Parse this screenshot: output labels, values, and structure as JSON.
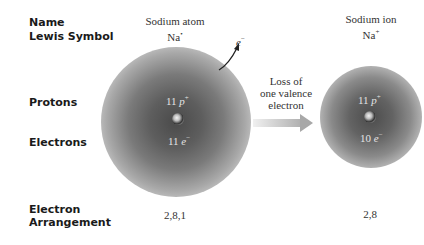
{
  "row_labels": {
    "name": "Name",
    "lewis_symbol": "Lewis Symbol",
    "protons": "Protons",
    "electrons": "Electrons",
    "electron_arrangement_line1": "Electron",
    "electron_arrangement_line2": "Arrangement"
  },
  "sodium_atom": {
    "name": "Sodium atom",
    "symbol": "Na",
    "symbol_mark": "•",
    "protons_count": "11",
    "protons_symbol": "p",
    "protons_charge": "+",
    "electrons_count": "11",
    "electrons_symbol": "e",
    "electrons_charge": "−",
    "arrangement": "2,8,1"
  },
  "lost_electron": {
    "symbol": "e",
    "charge": "−"
  },
  "process": {
    "line1": "Loss of",
    "line2": "one valence",
    "line3": "electron"
  },
  "sodium_ion": {
    "name": "Sodium ion",
    "symbol": "Na",
    "symbol_mark": "+",
    "protons_count": "11",
    "protons_symbol": "p",
    "protons_charge": "+",
    "electrons_count": "10",
    "electrons_symbol": "e",
    "electrons_charge": "−",
    "arrangement": "2,8"
  }
}
